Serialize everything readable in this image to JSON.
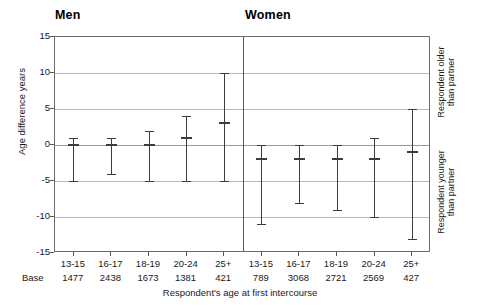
{
  "chart_data": {
    "type": "line",
    "title": "",
    "xlabel": "Respondent's age at first intercourse",
    "ylabel": "Age difference years",
    "ylim": [
      -15,
      15
    ],
    "yticks": [
      15,
      10,
      5,
      0,
      -5,
      -10,
      -15
    ],
    "ytick_labels": [
      "15",
      "10",
      "5",
      "0",
      "-5",
      "-10",
      "-15"
    ],
    "grid": true,
    "legend": "none",
    "categories": [
      "13-15",
      "16-17",
      "18-19",
      "20-24",
      "25+"
    ],
    "panels": [
      {
        "name": "Men",
        "base_label": "Base",
        "series": [
          {
            "category": "13-15",
            "median": 0,
            "lower": -5,
            "upper": 1,
            "base": 1477
          },
          {
            "category": "16-17",
            "median": 0,
            "lower": -4,
            "upper": 1,
            "base": 2438
          },
          {
            "category": "18-19",
            "median": 0,
            "lower": -5,
            "upper": 2,
            "base": 1673
          },
          {
            "category": "20-24",
            "median": 1,
            "lower": -5,
            "upper": 4,
            "base": 1381
          },
          {
            "category": "25+",
            "median": 3,
            "lower": -5,
            "upper": 10,
            "base": 421
          }
        ]
      },
      {
        "name": "Women",
        "series": [
          {
            "category": "13-15",
            "median": -2,
            "lower": -11,
            "upper": 0,
            "base": 789
          },
          {
            "category": "16-17",
            "median": -2,
            "lower": -8,
            "upper": 0,
            "base": 3068
          },
          {
            "category": "18-19",
            "median": -2,
            "lower": -9,
            "upper": 0,
            "base": 2721
          },
          {
            "category": "20-24",
            "median": -2,
            "lower": -10,
            "upper": 1,
            "base": 2569
          },
          {
            "category": "25+",
            "median": -1,
            "lower": -13,
            "upper": 5,
            "base": 427
          }
        ]
      }
    ],
    "annotations": {
      "upper_right": "Respondent older\nthan partner",
      "lower_right": "Respondent younger\nthan partner"
    }
  },
  "figure": {
    "title_men": "Men",
    "title_women": "Women",
    "ylabel": "Age difference years",
    "xlabel": "Respondent's age at first intercourse",
    "base_label": "Base",
    "note_older_line1": "Respondent older",
    "note_older_line2": "than partner",
    "note_younger_line1": "Respondent younger",
    "note_younger_line2": "than partner",
    "caption": ""
  }
}
